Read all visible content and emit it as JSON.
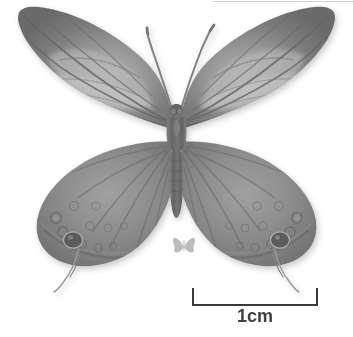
{
  "image": {
    "kind": "scanned-specimen-photograph",
    "subject": "butterfly-specimen-dorsal-view",
    "background_color": "#ffffff",
    "width": 353,
    "height": 337,
    "tone": "grayscale-halftone"
  },
  "scale_bar": {
    "label": "1cm",
    "value": 1,
    "unit": "cm",
    "color": "#3f3f3f",
    "bar_length_px": 126,
    "position": "bottom-right"
  },
  "watermark": {
    "name": "butterfly-silhouette-glyph",
    "color": "#bdbdbd",
    "position": "bottom-center"
  },
  "specimen": {
    "name": "butterfly",
    "view": "dorsal",
    "parts": [
      {
        "name": "left-forewing",
        "tone": "#3a3a3a"
      },
      {
        "name": "right-forewing",
        "tone": "#3a3a3a"
      },
      {
        "name": "left-hindwing",
        "tone": "#4a4a4a"
      },
      {
        "name": "right-hindwing",
        "tone": "#4a4a4a"
      },
      {
        "name": "thorax",
        "tone": "#2e2e2e"
      },
      {
        "name": "abdomen",
        "tone": "#3c3c3c"
      },
      {
        "name": "left-antenna",
        "tone": "#555555"
      },
      {
        "name": "right-antenna",
        "tone": "#555555"
      },
      {
        "name": "left-tail-filament",
        "tone": "#6a6a6a"
      },
      {
        "name": "right-tail-filament",
        "tone": "#6a6a6a"
      },
      {
        "name": "left-eyespot-large",
        "tone": "#1a1a1a"
      },
      {
        "name": "right-eyespot-large",
        "tone": "#1a1a1a"
      }
    ],
    "colors": {
      "wing_dark": "#343434",
      "wing_mid": "#5b5b5b",
      "wing_light": "#9b9b9b",
      "wing_highlight": "#c4c4c4",
      "body_dark": "#2b2b2b",
      "eyespot": "#141414"
    }
  }
}
